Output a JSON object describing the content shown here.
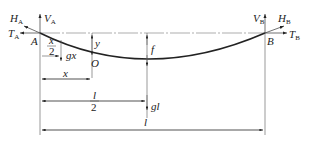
{
  "diagram": {
    "type": "cable sag free-body diagram",
    "labels": {
      "HA": "H",
      "HA_sub": "A",
      "VA": "V",
      "VA_sub": "A",
      "TA": "T",
      "TA_sub": "A",
      "A": "A",
      "x_half_num": "x",
      "x_half_den": "2",
      "gx": "gx",
      "y": "y",
      "O": "O",
      "x": "x",
      "f": "f",
      "l_half_num": "l",
      "l_half_den": "2",
      "gl": "gl",
      "l": "l",
      "VB": "V",
      "VB_sub": "B",
      "HB": "H",
      "HB_sub": "B",
      "TB": "T",
      "TB_sub": "B",
      "B": "B"
    },
    "colors": {
      "stroke": "#222222",
      "background": "#ffffff"
    }
  }
}
